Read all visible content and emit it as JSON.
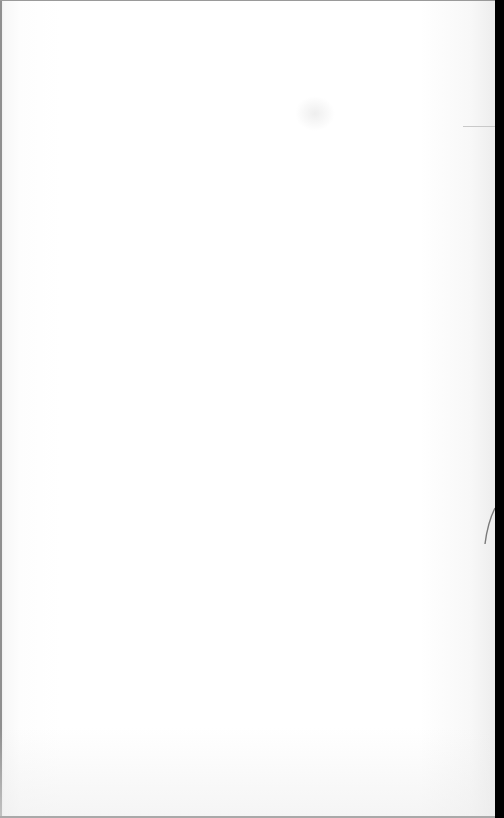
{
  "document": {
    "type": "blank-page-scan",
    "text": "",
    "colors": {
      "paper": "#ffffff",
      "page_edge": "#9a9a9a",
      "right_margin": "#000000"
    }
  }
}
